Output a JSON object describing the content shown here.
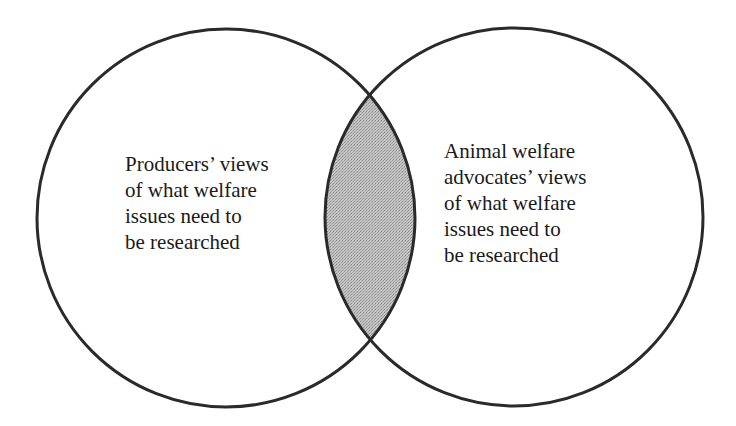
{
  "diagram": {
    "type": "venn",
    "colors": {
      "stroke": "#2a2a2a",
      "overlap_fill": "#b8b8b8",
      "background": "#ffffff"
    },
    "circles": [
      {
        "id": "producers",
        "label_lines": [
          "Producers’ views",
          "of what welfare",
          "issues need to",
          "be researched"
        ]
      },
      {
        "id": "advocates",
        "label_lines": [
          "Animal welfare",
          "advocates’ views",
          "of what welfare",
          "issues need to",
          "be researched"
        ]
      }
    ],
    "overlap": {
      "shaded": true
    }
  }
}
